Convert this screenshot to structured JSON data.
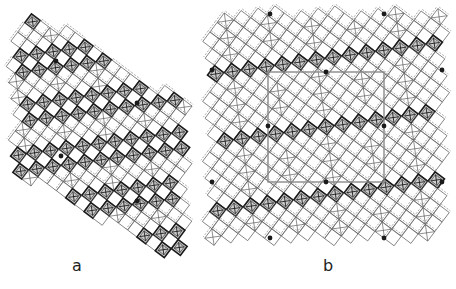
{
  "figure": {
    "panels": [
      {
        "id": "a",
        "label": "a",
        "description": "Tiling patch with hexagonal outline; diagonal bands of hatched dark squares alternating with open squares, with black dot markers",
        "dots": [
          [
            56,
            61
          ],
          [
            137,
            103
          ],
          [
            61,
            156
          ],
          [
            137,
            201
          ]
        ]
      },
      {
        "id": "b",
        "label": "b",
        "description": "Square tiling patch with outlined central unit cell; diagonal bands of hatched dark squares and black dot markers at cell corners/edges",
        "unit_cell": {
          "x": 268,
          "y": 72,
          "w": 116,
          "h": 110
        },
        "dots": [
          [
            326,
            72
          ],
          [
            268,
            126
          ],
          [
            384,
            126
          ],
          [
            326,
            182
          ],
          [
            270,
            14
          ],
          [
            384,
            14
          ],
          [
            270,
            238
          ],
          [
            384,
            238
          ],
          [
            212,
            70
          ],
          [
            442,
            70
          ],
          [
            212,
            182
          ],
          [
            442,
            182
          ]
        ]
      }
    ],
    "colors": {
      "ink": "#1a1a1a",
      "hatch": "#555555",
      "cell_outline": "#8a8a8a",
      "background": "#ffffff"
    }
  }
}
